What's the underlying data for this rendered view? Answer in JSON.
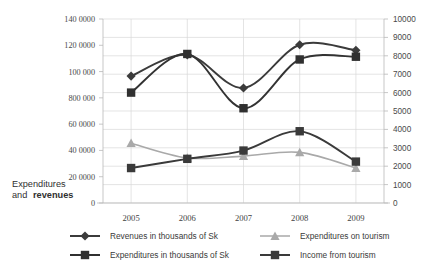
{
  "chart_data": {
    "type": "line",
    "title": "",
    "subtitle": "",
    "xlabel": "",
    "ylabel": "Expenditures and revenues",
    "ylabel_plain": "Expenditures",
    "ylabel_bold": "and revenues",
    "categories": [
      "2005",
      "2006",
      "2007",
      "2008",
      "2009"
    ],
    "grid": true,
    "legend_position": "bottom",
    "y_left": {
      "label": "Expenditures and revenues",
      "ticks": [
        "0",
        "20 0000",
        "40 0000",
        "60 0000",
        "800 000",
        "100 000",
        "120 0000",
        "140 0000"
      ],
      "tick_values": [
        0,
        200000,
        400000,
        600000,
        800000,
        1000000,
        1200000,
        1400000
      ],
      "ylim": [
        0,
        1400000
      ]
    },
    "y_right": {
      "label": "",
      "ticks": [
        "0",
        "1000",
        "2000",
        "3000",
        "4000",
        "5000",
        "6000",
        "7000",
        "8000",
        "9000",
        "10000"
      ],
      "tick_values": [
        0,
        1000,
        2000,
        3000,
        4000,
        5000,
        6000,
        7000,
        8000,
        9000,
        10000
      ],
      "ylim": [
        0,
        10000
      ]
    },
    "series": [
      {
        "name": "Revenues in thousands of Sk",
        "marker": "diamond",
        "color": "#3b3b3b",
        "axis": "right",
        "values": [
          6900,
          8050,
          6250,
          8600,
          8300
        ]
      },
      {
        "name": "Expenditures in thousands of Sk",
        "marker": "square",
        "color": "#303030",
        "axis": "right",
        "values": [
          6000,
          8100,
          5150,
          7800,
          7950
        ]
      },
      {
        "name": "Expenditures on tourism",
        "marker": "triangle",
        "color": "#a9a9a9",
        "axis": "right",
        "values": [
          3250,
          2450,
          2550,
          2750,
          1900
        ]
      },
      {
        "name": "Income from tourism",
        "marker": "square",
        "color": "#3a3a3a",
        "axis": "right",
        "values": [
          1900,
          2400,
          2850,
          3900,
          2250
        ]
      }
    ]
  },
  "legend": {
    "items": [
      {
        "label": "Revenues in thousands of Sk",
        "marker": "diamond",
        "color": "#3b3b3b"
      },
      {
        "label": "Expenditures in thousands of Sk",
        "marker": "square",
        "color": "#303030"
      },
      {
        "label": "Expenditures on tourism",
        "marker": "triangle",
        "color": "#a9a9a9"
      },
      {
        "label": "Income from tourism",
        "marker": "square",
        "color": "#3a3a3a"
      }
    ]
  }
}
